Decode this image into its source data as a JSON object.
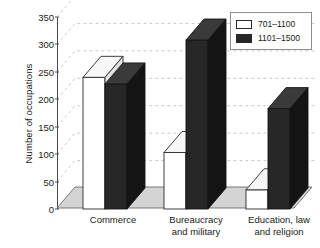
{
  "chart_data": {
    "type": "bar",
    "title": "",
    "xlabel": "",
    "ylabel": "Number of occupations",
    "ylim": [
      0,
      350
    ],
    "ytick_labels": [
      "0",
      "50",
      "100",
      "150",
      "200",
      "250",
      "300",
      "350"
    ],
    "ytick_values": [
      0,
      50,
      100,
      150,
      200,
      250,
      300,
      350
    ],
    "grid": true,
    "legend_position": "top-right",
    "style": "3d-bar",
    "categories": [
      "Commerce",
      "Bureaucracy\nand military",
      "Education, law\nand religion"
    ],
    "series": [
      {
        "name": "701–1100",
        "color": "#ffffff",
        "edge_color": "#2a2a2a",
        "values": [
          240,
          103,
          35
        ]
      },
      {
        "name": "1101–1500",
        "color": "#272727",
        "edge_color": "#151515",
        "values": [
          228,
          308,
          183
        ]
      }
    ]
  },
  "legend": {
    "items": [
      {
        "label": "701–1100",
        "swatch": "open"
      },
      {
        "label": "1101–1500",
        "swatch": "filled"
      }
    ]
  },
  "colors": {
    "bar_light": "#ffffff",
    "bar_dark": "#272727",
    "floor": "#d4d4d4",
    "axis": "#4a4a4a",
    "grid": "#bcbcbc",
    "text": "#1a1a1a"
  }
}
